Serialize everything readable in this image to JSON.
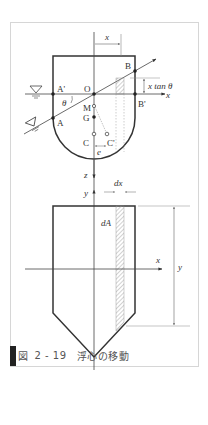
{
  "figure": {
    "caption": {
      "label": "図",
      "number": "2 - 19",
      "title": "浮心の移動"
    },
    "colors": {
      "frame": "#d6d6d6",
      "outline": "#333333",
      "axis": "#444444",
      "dim_line": "#888888",
      "hatch": "#999999",
      "caption_bar": "#222222",
      "caption_text": "#555555"
    },
    "top_view": {
      "labels": {
        "x_dim": "x",
        "B": "B",
        "B_prime": "B'",
        "A": "A",
        "A_prime": "A'",
        "O": "O",
        "M": "M",
        "G": "G",
        "C": "C",
        "C_prime": "C'",
        "e": "e",
        "theta": "θ",
        "x_tan_theta": "x tan θ",
        "x_axis": "x",
        "z_axis": "z"
      },
      "water_surface_symbols": [
        "water-level-upright",
        "water-level-tilted"
      ]
    },
    "bottom_view": {
      "labels": {
        "y_axis": "y",
        "x_axis": "x",
        "dx": "dx",
        "dA": "dA",
        "y_dim": "y"
      }
    }
  }
}
